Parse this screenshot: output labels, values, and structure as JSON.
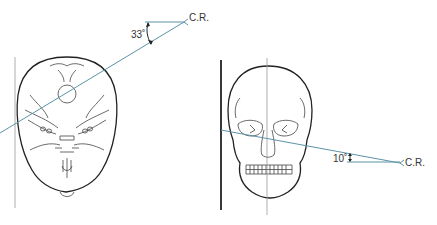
{
  "figure": {
    "left_view": {
      "name": "Submentovertical / axial skull view",
      "angle_label": "33˚",
      "cr_label": "C.R.",
      "angle_degrees": 33
    },
    "right_view": {
      "name": "Frontal (PA) skull view",
      "angle_label": "10˚",
      "cr_label": "C.R.",
      "angle_degrees": 10
    },
    "colors": {
      "central_ray": "#5b93a8",
      "outline": "#222222",
      "reference_line": "#999999"
    }
  }
}
